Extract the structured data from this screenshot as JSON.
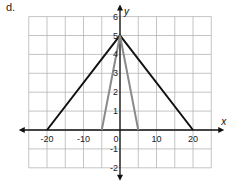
{
  "problem_label": "d.",
  "chart_data": {
    "type": "line",
    "title": "",
    "xlabel": "x",
    "ylabel": "y",
    "xlim": [
      -25,
      25
    ],
    "ylim": [
      -2,
      6
    ],
    "x_ticks": [
      -20,
      -10,
      0,
      10,
      20
    ],
    "x_tick_labels": [
      "-20",
      "-10",
      "0",
      "10",
      "20"
    ],
    "y_ticks": [
      6,
      5,
      4,
      3,
      2,
      1,
      -1,
      -2
    ],
    "y_tick_labels": [
      "6",
      "5",
      "4",
      "3",
      "2",
      "1",
      "-1",
      "-2"
    ],
    "grid": true,
    "grid_x_step": 5,
    "grid_y_step": 1,
    "series": [
      {
        "name": "wide triangle",
        "color": "#111111",
        "x": [
          -20,
          0,
          20
        ],
        "y": [
          0,
          5,
          0
        ]
      },
      {
        "name": "narrow triangle",
        "color": "#8a8a8a",
        "x": [
          -5,
          0,
          5
        ],
        "y": [
          0,
          5,
          0
        ]
      }
    ]
  }
}
